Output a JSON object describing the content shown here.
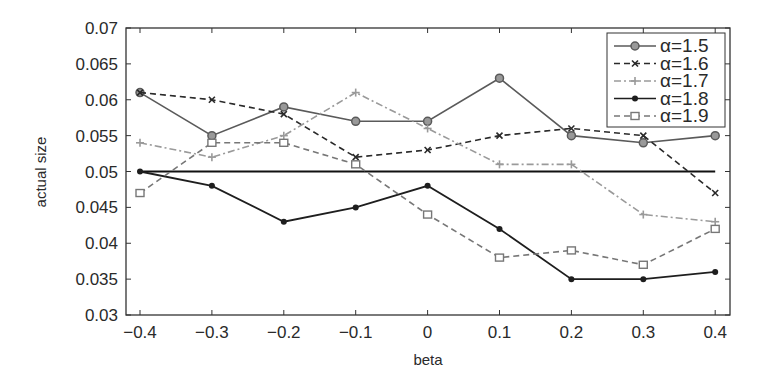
{
  "chart_data": {
    "type": "line",
    "title": "",
    "xlabel": "beta",
    "ylabel": "actual size",
    "x": [
      -0.4,
      -0.3,
      -0.2,
      -0.1,
      0,
      0.1,
      0.2,
      0.3,
      0.4
    ],
    "xticks": [
      "−0.4",
      "−0.3",
      "−0.2",
      "−0.1",
      "0",
      "0.1",
      "0.2",
      "0.3",
      "0.4"
    ],
    "yticks": [
      "0.03",
      "0.035",
      "0.04",
      "0.045",
      "0.05",
      "0.055",
      "0.06",
      "0.065",
      "0.07"
    ],
    "xlim": [
      -0.42,
      0.42
    ],
    "ylim": [
      0.03,
      0.07
    ],
    "grid": false,
    "legend_position": "upper right",
    "reference_line": {
      "y": 0.05,
      "color": "#111111"
    },
    "series": [
      {
        "name": "α=1.5",
        "style": "solid",
        "marker": "circle",
        "color": "#5a5a5a",
        "values": [
          0.061,
          0.055,
          0.059,
          0.057,
          0.057,
          0.063,
          0.055,
          0.054,
          0.055
        ]
      },
      {
        "name": "α=1.6",
        "style": "dashed",
        "marker": "x",
        "color": "#2a2a2a",
        "values": [
          0.061,
          0.06,
          0.058,
          0.052,
          0.053,
          0.055,
          0.056,
          0.055,
          0.047
        ]
      },
      {
        "name": "α=1.7",
        "style": "dashdot",
        "marker": "plus",
        "color": "#9a9a9a",
        "values": [
          0.054,
          0.052,
          0.055,
          0.061,
          0.056,
          0.051,
          0.051,
          0.044,
          0.043
        ]
      },
      {
        "name": "α=1.8",
        "style": "solid",
        "marker": "dot",
        "color": "#1e1e1e",
        "values": [
          0.05,
          0.048,
          0.043,
          0.045,
          0.048,
          0.042,
          0.035,
          0.035,
          0.036
        ]
      },
      {
        "name": "α=1.9",
        "style": "dashed",
        "marker": "square",
        "color": "#777777",
        "values": [
          0.047,
          0.054,
          0.054,
          0.051,
          0.044,
          0.038,
          0.039,
          0.037,
          0.042
        ]
      }
    ]
  }
}
